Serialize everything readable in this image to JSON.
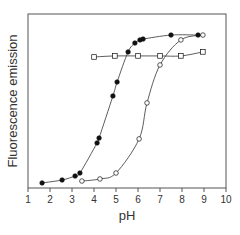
{
  "chart_data": {
    "type": "scatter",
    "title": "",
    "xlabel": "pH",
    "ylabel": "Fluorescence emission",
    "xlim": [
      1,
      10
    ],
    "ylim": [
      0,
      100
    ],
    "xticks": [
      1,
      2,
      3,
      4,
      5,
      6,
      7,
      8,
      9,
      10
    ],
    "yticks": [],
    "grid": false,
    "legend": null,
    "series": [
      {
        "name": "filled-circles",
        "marker": "filled-circle",
        "fitted_curve": true,
        "points": [
          [
            1.64,
            2.9
          ],
          [
            2.55,
            4.6
          ],
          [
            3.14,
            6.9
          ],
          [
            3.36,
            8.6
          ],
          [
            4.14,
            25.9
          ],
          [
            4.23,
            28.7
          ],
          [
            4.86,
            52.9
          ],
          [
            5.05,
            60.9
          ],
          [
            5.55,
            78.2
          ],
          [
            5.86,
            83.3
          ],
          [
            6.09,
            85.1
          ],
          [
            6.23,
            85.6
          ],
          [
            7.5,
            87.9
          ],
          [
            8.73,
            87.9
          ]
        ]
      },
      {
        "name": "open-circles",
        "marker": "open-circle",
        "fitted_curve": true,
        "points": [
          [
            3.45,
            4.0
          ],
          [
            4.27,
            5.2
          ],
          [
            5.0,
            8.6
          ],
          [
            6.05,
            28.2
          ],
          [
            6.41,
            48.9
          ],
          [
            7.0,
            70.7
          ],
          [
            7.95,
            85.1
          ],
          [
            8.95,
            87.9
          ]
        ]
      },
      {
        "name": "open-squares",
        "marker": "open-square",
        "fitted_curve": true,
        "points": [
          [
            4.0,
            75.3
          ],
          [
            4.95,
            75.9
          ],
          [
            6.0,
            75.9
          ],
          [
            7.0,
            75.9
          ],
          [
            7.95,
            75.9
          ],
          [
            8.95,
            78.2
          ]
        ]
      }
    ]
  },
  "colors": {
    "frame": "#555555",
    "line": "#333333",
    "marker": "#111111"
  }
}
